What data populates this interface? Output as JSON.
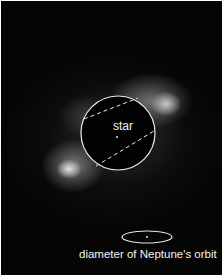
{
  "image": {
    "description": "Grayscale telescope image of a dusty disk around a star with a masked central circle",
    "colors": {
      "background": "#050505",
      "annotation": "#f2f2f2",
      "border": "#ffffff"
    }
  },
  "annotations": {
    "star_label": "star",
    "orbit_label": "diameter of Neptune's orbit"
  }
}
